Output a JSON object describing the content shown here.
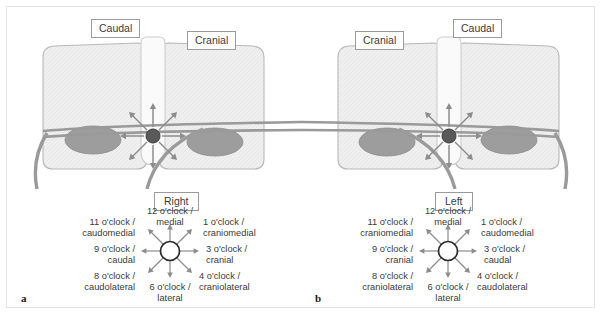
{
  "figure": {
    "panels": [
      {
        "letter": "a",
        "side_label": "Right",
        "orientation_left": "Caudal",
        "orientation_right": "Cranial",
        "mirrored": false,
        "clock_positions": [
          {
            "hour": "12 o'clock /",
            "direction": "medial",
            "angle": 90
          },
          {
            "hour": "1 o'clock /",
            "direction": "craniomedial",
            "angle": 45
          },
          {
            "hour": "3 o'clock /",
            "direction": "cranial",
            "angle": 0
          },
          {
            "hour": "4 o'clock /",
            "direction": "craniolateral",
            "angle": -45
          },
          {
            "hour": "6 o'clock /",
            "direction": "lateral",
            "angle": -90
          },
          {
            "hour": "8 o'clock /",
            "direction": "caudolateral",
            "angle": -135
          },
          {
            "hour": "9 o'clock /",
            "direction": "caudal",
            "angle": 180
          },
          {
            "hour": "11 o'clock /",
            "direction": "caudomedial",
            "angle": 135
          }
        ]
      },
      {
        "letter": "b",
        "side_label": "Left",
        "orientation_left": "Cranial",
        "orientation_right": "Caudal",
        "mirrored": true,
        "clock_positions": [
          {
            "hour": "12 o'clock /",
            "direction": "medial",
            "angle": 90
          },
          {
            "hour": "1 o'clock /",
            "direction": "caudomedial",
            "angle": 45
          },
          {
            "hour": "3 o'clock /",
            "direction": "caudal",
            "angle": 0
          },
          {
            "hour": "4 o'clock /",
            "direction": "caudolateral",
            "angle": -45
          },
          {
            "hour": "6 o'clock /",
            "direction": "lateral",
            "angle": -90
          },
          {
            "hour": "8 o'clock /",
            "direction": "craniolateral",
            "angle": -135
          },
          {
            "hour": "9 o'clock /",
            "direction": "cranial",
            "angle": 180
          },
          {
            "hour": "11 o'clock /",
            "direction": "craniomedial",
            "angle": 135
          }
        ]
      }
    ]
  },
  "colors": {
    "vertebra_fill": "#efefef",
    "vertebra_stroke": "#b8b8b8",
    "spinous_fill": "#fafafa",
    "facet_oval_fill": "#9d9d9d",
    "nerve_stroke": "#9a9a9a",
    "target_dot": "#5a5a5a",
    "arrow": "#8c8c8c",
    "frame_border": "#e3e3e3",
    "box_border": "#9b9b9b",
    "text": "#3a3a3a"
  }
}
